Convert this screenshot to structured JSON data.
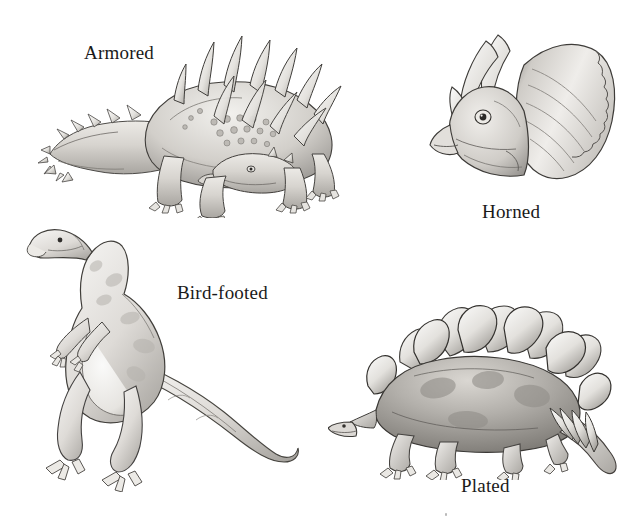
{
  "figure": {
    "background_color": "#ffffff",
    "ink_color": "#1a1a1a",
    "width": 619,
    "height": 532,
    "medium": "pencil-drawing"
  },
  "labels": {
    "armored": "Armored",
    "horned": "Horned",
    "bird_footed": "Bird-footed",
    "plated": "Plated"
  },
  "illustrations": [
    {
      "id": "armored",
      "name": "armored-dinosaur-illustration",
      "subject": "ankylosaur",
      "description": "Quadrupedal armored dinosaur in left profile, low slung body covered in bony knobs, two rows of large conical shoulder and back spikes, spiked club-less tapering tail curving left, small triangular head at right.",
      "label": "Armored",
      "label_position": "upper-left",
      "quadrant": "top-left"
    },
    {
      "id": "horned",
      "name": "horned-dinosaur-illustration",
      "subject": "triceratops-head",
      "description": "Head-and-frill portrait of a horned dinosaur facing left, two long curved brow horns, a short nose horn, hooked beak and a large scalloped neck frill fanning to the right.",
      "label": "Horned",
      "label_position": "below",
      "quadrant": "top-right"
    },
    {
      "id": "bird_footed",
      "name": "bird-footed-dinosaur-illustration",
      "subject": "hadrosaur-iguanodont",
      "description": "Bipedal ornithopod standing upright facing left, long neck and narrow beaked head raised, small forelimbs held in front, heavy hind legs with three-toed bird-like feet, long tapering tail curving to the right.",
      "label": "Bird-footed",
      "label_position": "right-of-figure",
      "quadrant": "bottom-left"
    },
    {
      "id": "plated",
      "name": "plated-dinosaur-illustration",
      "subject": "stegosaurus",
      "description": "Quadrupedal plated dinosaur in left profile with arched back, double row of large diamond-shaped dorsal plates, small head lowered at left, four thagomizer tail spikes at lower right.",
      "label": "Plated",
      "label_position": "below",
      "quadrant": "bottom-right"
    }
  ],
  "artifacts": {
    "speck": "small grey speck near bottom right of scanned page"
  }
}
